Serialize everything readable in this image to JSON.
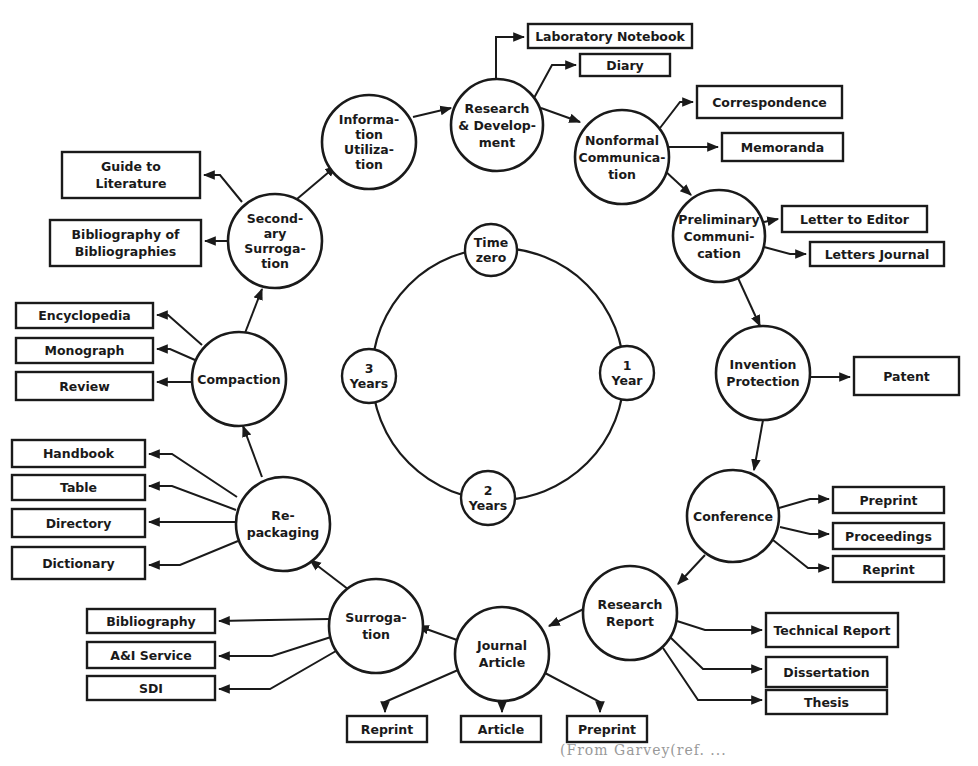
{
  "diagram": {
    "colors": {
      "stroke": "#1a1a1a",
      "background": "#ffffff"
    },
    "time_ring": {
      "center": [
        498,
        374
      ],
      "radius": 126,
      "markers": [
        {
          "id": "time-zero",
          "lines": [
            "Time",
            "zero"
          ],
          "cx": 491,
          "cy": 250,
          "r": 26
        },
        {
          "id": "one-year",
          "lines": [
            "1",
            "Year"
          ],
          "cx": 627,
          "cy": 373,
          "r": 27
        },
        {
          "id": "two-years",
          "lines": [
            "2",
            "Years"
          ],
          "cx": 488,
          "cy": 498,
          "r": 27
        },
        {
          "id": "three-years",
          "lines": [
            "3",
            "Years"
          ],
          "cx": 369,
          "cy": 376,
          "r": 27
        }
      ]
    },
    "stages": [
      {
        "id": "research-development",
        "lines": [
          "Research",
          "& Develop-",
          "ment"
        ],
        "cx": 497,
        "cy": 125,
        "r": 46
      },
      {
        "id": "nonformal-communication",
        "lines": [
          "Nonformal",
          "Communica-",
          "tion"
        ],
        "cx": 622,
        "cy": 157,
        "r": 47
      },
      {
        "id": "preliminary-communication",
        "lines": [
          "Preliminary",
          "Communi-",
          "cation"
        ],
        "cx": 719,
        "cy": 236,
        "r": 46
      },
      {
        "id": "invention-protection",
        "lines": [
          "Invention",
          "Protection"
        ],
        "cx": 763,
        "cy": 373,
        "r": 47
      },
      {
        "id": "conference",
        "lines": [
          "Conference"
        ],
        "cx": 733,
        "cy": 516,
        "r": 46
      },
      {
        "id": "research-report",
        "lines": [
          "Research",
          "Report"
        ],
        "cx": 630,
        "cy": 613,
        "r": 47
      },
      {
        "id": "journal-article",
        "lines": [
          "Journal",
          "Article"
        ],
        "cx": 502,
        "cy": 654,
        "r": 47
      },
      {
        "id": "surrogation",
        "lines": [
          "Surroga-",
          "tion"
        ],
        "cx": 376,
        "cy": 626,
        "r": 47
      },
      {
        "id": "repackaging",
        "lines": [
          "Re-",
          "packaging"
        ],
        "cx": 283,
        "cy": 524,
        "r": 47
      },
      {
        "id": "compaction",
        "lines": [
          "Compaction"
        ],
        "cx": 239,
        "cy": 379,
        "r": 47
      },
      {
        "id": "secondary-surrogation",
        "lines": [
          "Second-",
          "ary",
          "Surroga-",
          "tion"
        ],
        "cx": 275,
        "cy": 241,
        "r": 47
      },
      {
        "id": "information-utilization",
        "lines": [
          "Informa-",
          "tion",
          "Utiliza-",
          "tion"
        ],
        "cx": 369,
        "cy": 142,
        "r": 47
      }
    ],
    "flow": [
      {
        "from": "information-utilization",
        "to": "research-development",
        "path": "M413,117 L451,108"
      },
      {
        "from": "research-development",
        "to": "nonformal-communication",
        "path": "M541,108 L580,122"
      },
      {
        "from": "nonformal-communication",
        "to": "preliminary-communication",
        "path": "M664,170 L691,195"
      },
      {
        "from": "preliminary-communication",
        "to": "invention-protection",
        "path": "M738,278 L760,326"
      },
      {
        "from": "invention-protection",
        "to": "conference",
        "path": "M763,420 L754,470"
      },
      {
        "from": "conference",
        "to": "research-report",
        "path": "M705,555 L678,584"
      },
      {
        "from": "research-report",
        "to": "journal-article",
        "path": "M608,597 L549,626"
      },
      {
        "from": "journal-article",
        "to": "surrogation",
        "path": "M457,640 L418,626"
      },
      {
        "from": "surrogation",
        "to": "repackaging",
        "path": "M357,596 L310,560"
      },
      {
        "from": "repackaging",
        "to": "compaction",
        "path": "M262,477 L243,426"
      },
      {
        "from": "compaction",
        "to": "secondary-surrogation",
        "path": "M245,333 L262,289"
      },
      {
        "from": "secondary-surrogation",
        "to": "information-utilization",
        "path": "M297,199 L336,166"
      }
    ],
    "outputs": [
      {
        "id": "laboratory-notebook",
        "label": "Laboratory Notebook",
        "x": 528,
        "y": 24,
        "w": 164,
        "h": 24,
        "path": "M496,79 L496,37 L524,37",
        "dir": "right"
      },
      {
        "id": "diary",
        "label": "Diary",
        "x": 580,
        "y": 54,
        "w": 90,
        "h": 22,
        "path": "M534,98 L552,65 L576,65",
        "dir": "right"
      },
      {
        "id": "correspondence",
        "label": "Correspondence",
        "x": 697,
        "y": 86,
        "w": 145,
        "h": 32,
        "path": "M660,128 L680,102 L693,102",
        "dir": "right"
      },
      {
        "id": "memoranda",
        "label": "Memoranda",
        "x": 722,
        "y": 133,
        "w": 121,
        "h": 28,
        "path": "M668,147 L718,147",
        "dir": "right"
      },
      {
        "id": "letter-to-editor",
        "label": "Letter to Editor",
        "x": 782,
        "y": 206,
        "w": 145,
        "h": 26,
        "path": "M764,222 L778,219",
        "dir": "right"
      },
      {
        "id": "letters-journal",
        "label": "Letters Journal",
        "x": 810,
        "y": 242,
        "w": 134,
        "h": 24,
        "path": "M764,247 L790,254 L806,254",
        "dir": "right"
      },
      {
        "id": "patent",
        "label": "Patent",
        "x": 854,
        "y": 357,
        "w": 105,
        "h": 38,
        "path": "M810,377 L850,377",
        "dir": "right"
      },
      {
        "id": "preprint-conference",
        "label": "Preprint",
        "x": 833,
        "y": 487,
        "w": 111,
        "h": 26,
        "path": "M779,508 L810,499 L829,499",
        "dir": "right"
      },
      {
        "id": "proceedings",
        "label": "Proceedings",
        "x": 833,
        "y": 523,
        "w": 111,
        "h": 26,
        "path": "M780,527 L810,534 L829,534",
        "dir": "right"
      },
      {
        "id": "reprint-conference",
        "label": "Reprint",
        "x": 833,
        "y": 556,
        "w": 111,
        "h": 26,
        "path": "M773,540 L808,568 L829,568",
        "dir": "right"
      },
      {
        "id": "technical-report",
        "label": "Technical Report",
        "x": 766,
        "y": 613,
        "w": 132,
        "h": 34,
        "path": "M677,621 L705,630 L762,630",
        "dir": "right"
      },
      {
        "id": "dissertation",
        "label": "Dissertation",
        "x": 766,
        "y": 657,
        "w": 121,
        "h": 30,
        "path": "M670,637 L703,669 L762,669",
        "dir": "right"
      },
      {
        "id": "thesis",
        "label": "Thesis",
        "x": 766,
        "y": 690,
        "w": 121,
        "h": 24,
        "path": "M663,648 L698,700 L762,700",
        "dir": "right"
      },
      {
        "id": "reprint-journal",
        "label": "Reprint",
        "x": 347,
        "y": 716,
        "w": 80,
        "h": 26,
        "path": "M458,670 L385,702 L385,712",
        "dir": "down"
      },
      {
        "id": "article",
        "label": "Article",
        "x": 461,
        "y": 716,
        "w": 80,
        "h": 26,
        "path": "M502,701 L502,712",
        "dir": "down"
      },
      {
        "id": "preprint-journal",
        "label": "Preprint",
        "x": 567,
        "y": 716,
        "w": 80,
        "h": 26,
        "path": "M545,673 L600,702 L600,712",
        "dir": "down"
      },
      {
        "id": "bibliography",
        "label": "Bibliography",
        "x": 87,
        "y": 609,
        "w": 128,
        "h": 24,
        "path": "M330,619 L219,621",
        "dir": "left"
      },
      {
        "id": "ai-service",
        "label": "A&I Service",
        "x": 87,
        "y": 642,
        "w": 128,
        "h": 26,
        "path": "M331,637 L272,656 L219,656",
        "dir": "left"
      },
      {
        "id": "sdi",
        "label": "SDI",
        "x": 87,
        "y": 676,
        "w": 128,
        "h": 24,
        "path": "M336,651 L270,689 L219,689",
        "dir": "left"
      },
      {
        "id": "handbook",
        "label": "Handbook",
        "x": 12,
        "y": 440,
        "w": 133,
        "h": 27,
        "path": "M237,497 L172,454 L149,454",
        "dir": "left"
      },
      {
        "id": "table",
        "label": "Table",
        "x": 12,
        "y": 475,
        "w": 133,
        "h": 25,
        "path": "M236,510 L172,486 L149,486",
        "dir": "left"
      },
      {
        "id": "directory",
        "label": "Directory",
        "x": 12,
        "y": 509,
        "w": 133,
        "h": 28,
        "path": "M236,522 L149,522",
        "dir": "left"
      },
      {
        "id": "dictionary",
        "label": "Dictionary",
        "x": 12,
        "y": 547,
        "w": 133,
        "h": 32,
        "path": "M238,541 L180,565 L149,565",
        "dir": "left"
      },
      {
        "id": "encyclopedia",
        "label": "Encyclopedia",
        "x": 16,
        "y": 303,
        "w": 137,
        "h": 25,
        "path": "M202,345 L168,315 L157,315",
        "dir": "left"
      },
      {
        "id": "monograph",
        "label": "Monograph",
        "x": 16,
        "y": 338,
        "w": 137,
        "h": 25,
        "path": "M195,360 L170,349 L157,349",
        "dir": "left"
      },
      {
        "id": "review",
        "label": "Review",
        "x": 16,
        "y": 372,
        "w": 137,
        "h": 28,
        "path": "M192,382 L157,382",
        "dir": "left"
      },
      {
        "id": "guide-to-literature",
        "label": "Guide to|Literature",
        "x": 62,
        "y": 152,
        "w": 138,
        "h": 46,
        "path": "M242,202 L220,175 L204,175",
        "dir": "left"
      },
      {
        "id": "bibliography-of-bibliographies",
        "label": "Bibliography of|Bibliographies",
        "x": 50,
        "y": 220,
        "w": 151,
        "h": 46,
        "path": "M228,241 L205,241",
        "dir": "left"
      }
    ],
    "caption": "(From Garvey(ref. ..."
  }
}
